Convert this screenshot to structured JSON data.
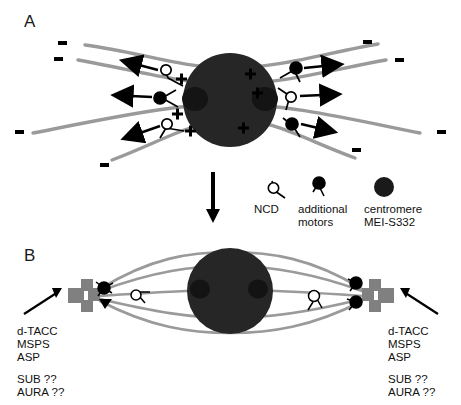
{
  "figure": {
    "type": "scientific-diagram",
    "title_absent": true,
    "background": "#ffffff",
    "colors": {
      "microtubule_gray": "#9a9a9a",
      "pole_body_gray": "#808080",
      "chromatin_black": "#262626",
      "centromere_black": "#1a1a1a",
      "text_black": "#111111"
    }
  },
  "panels": {
    "a": {
      "label": "A",
      "description": "acentrosomal spindle with chromatin mass, microtubules, motors",
      "minus_end_marks": 8,
      "plus_signs": [
        "+",
        "+",
        "+",
        "+",
        "+",
        "+"
      ],
      "minus_signs": [
        "-",
        "-",
        "-",
        "-",
        "-",
        "-",
        "-",
        "-"
      ]
    },
    "b": {
      "label": "B",
      "description": "bipolar spindle with focused poles",
      "left_pole_labels": [
        "d-TACC",
        "MSPS",
        "ASP",
        "SUB ??",
        "AURA ??"
      ],
      "right_pole_labels": [
        "d-TACC",
        "MSPS",
        "ASP",
        "SUB ??",
        "AURA ??"
      ]
    }
  },
  "legend": {
    "items": [
      {
        "symbol": "open-circle-motor",
        "label": "NCD"
      },
      {
        "symbol": "filled-circle-motor",
        "label": "additional\nmotors"
      },
      {
        "symbol": "large-filled-circle",
        "label": "centromere\nMEI-S332"
      }
    ],
    "ncd_label": "NCD",
    "additional_motors_line1": "additional",
    "additional_motors_line2": "motors",
    "centromere_line1": "centromere",
    "centromere_line2": "MEI-S332"
  },
  "transition": {
    "arrow": "down-arrow"
  },
  "pole_text": {
    "line1": "d-TACC",
    "line2": "MSPS",
    "line3": "ASP",
    "line4": "SUB ??",
    "line5": "AURA ??"
  }
}
